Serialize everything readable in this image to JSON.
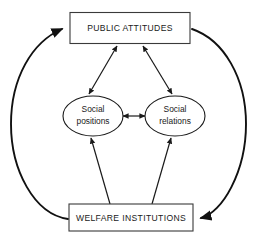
{
  "diagram": {
    "background_color": "#ffffff",
    "stroke_color": "#1a1a1a",
    "text_color": "#1a1a1a",
    "nodes": {
      "top_box": {
        "label": "PUBLIC ATTITUDES",
        "shape": "rectangle"
      },
      "bottom_box": {
        "label": "WELFARE INSTITUTIONS",
        "shape": "rectangle"
      },
      "left_ellipse": {
        "label_line1": "Social",
        "label_line2": "positions",
        "shape": "ellipse"
      },
      "right_ellipse": {
        "label_line1": "Social",
        "label_line2": "relations",
        "shape": "ellipse"
      }
    },
    "edges": [
      {
        "id": "public-attitudes-to-social-positions",
        "from": "top_box",
        "to": "left_ellipse",
        "style": "straight",
        "arrowheads": "both"
      },
      {
        "id": "public-attitudes-to-social-relations",
        "from": "top_box",
        "to": "right_ellipse",
        "style": "straight",
        "arrowheads": "both"
      },
      {
        "id": "social-positions-to-social-relations",
        "from": "left_ellipse",
        "to": "right_ellipse",
        "style": "straight",
        "arrowheads": "both"
      },
      {
        "id": "welfare-institutions-to-social-positions",
        "from": "bottom_box",
        "to": "left_ellipse",
        "style": "straight",
        "arrowheads": "end"
      },
      {
        "id": "welfare-institutions-to-social-relations",
        "from": "bottom_box",
        "to": "right_ellipse",
        "style": "straight",
        "arrowheads": "end"
      },
      {
        "id": "welfare-institutions-to-public-attitudes",
        "from": "bottom_box",
        "to": "top_box",
        "style": "curve-left",
        "arrowheads": "end"
      },
      {
        "id": "public-attitudes-to-welfare-institutions",
        "from": "top_box",
        "to": "bottom_box",
        "style": "curve-right",
        "arrowheads": "end"
      }
    ]
  }
}
